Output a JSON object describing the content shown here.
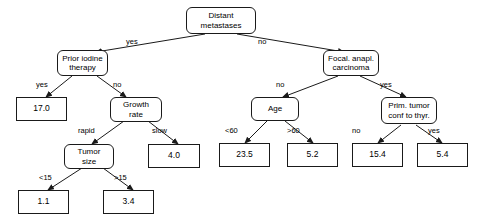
{
  "diagram": {
    "type": "decision-tree",
    "title": "",
    "nodes": [
      {
        "id": "root",
        "kind": "internal",
        "lines": [
          "Distant",
          "metastases"
        ]
      },
      {
        "id": "prior_iodine",
        "kind": "internal",
        "lines": [
          "Prior iodine",
          "therapy"
        ]
      },
      {
        "id": "focal_anapl",
        "kind": "internal",
        "lines": [
          "Focal. anapl.",
          "carcinoma"
        ]
      },
      {
        "id": "leaf_17",
        "kind": "leaf",
        "lines": [
          "17.0"
        ]
      },
      {
        "id": "growth_rate",
        "kind": "internal",
        "lines": [
          "Growth",
          "rate"
        ]
      },
      {
        "id": "age",
        "kind": "internal",
        "lines": [
          "Age"
        ]
      },
      {
        "id": "prim_tumor",
        "kind": "internal",
        "lines": [
          "Prim. tumor",
          "conf to thyr."
        ]
      },
      {
        "id": "tumor_size",
        "kind": "internal",
        "lines": [
          "Tumor",
          "size"
        ]
      },
      {
        "id": "leaf_40",
        "kind": "leaf",
        "lines": [
          "4.0"
        ]
      },
      {
        "id": "leaf_235",
        "kind": "leaf",
        "lines": [
          "23.5"
        ]
      },
      {
        "id": "leaf_52",
        "kind": "leaf",
        "lines": [
          "5.2"
        ]
      },
      {
        "id": "leaf_154",
        "kind": "leaf",
        "lines": [
          "15.4"
        ]
      },
      {
        "id": "leaf_54",
        "kind": "leaf",
        "lines": [
          "5.4"
        ]
      },
      {
        "id": "leaf_11",
        "kind": "leaf",
        "lines": [
          "1.1"
        ]
      },
      {
        "id": "leaf_34",
        "kind": "leaf",
        "lines": [
          "3.4"
        ]
      }
    ],
    "edges": [
      {
        "from": "root",
        "to": "prior_iodine",
        "label": "yes"
      },
      {
        "from": "root",
        "to": "focal_anapl",
        "label": "no"
      },
      {
        "from": "prior_iodine",
        "to": "leaf_17",
        "label": "yes"
      },
      {
        "from": "prior_iodine",
        "to": "growth_rate",
        "label": "no"
      },
      {
        "from": "growth_rate",
        "to": "tumor_size",
        "label": "rapid"
      },
      {
        "from": "growth_rate",
        "to": "leaf_40",
        "label": "slow"
      },
      {
        "from": "tumor_size",
        "to": "leaf_11",
        "label": "<15"
      },
      {
        "from": "tumor_size",
        "to": "leaf_34",
        "label": ">15"
      },
      {
        "from": "focal_anapl",
        "to": "age",
        "label": "no"
      },
      {
        "from": "focal_anapl",
        "to": "prim_tumor",
        "label": "yes"
      },
      {
        "from": "age",
        "to": "leaf_235",
        "label": "<60"
      },
      {
        "from": "age",
        "to": "leaf_52",
        "label": ">60"
      },
      {
        "from": "prim_tumor",
        "to": "leaf_154",
        "label": "no"
      },
      {
        "from": "prim_tumor",
        "to": "leaf_54",
        "label": "yes"
      }
    ],
    "colors": {
      "stroke": "#1a1a1a",
      "fill": "#ffffff",
      "text": "#000000"
    }
  }
}
